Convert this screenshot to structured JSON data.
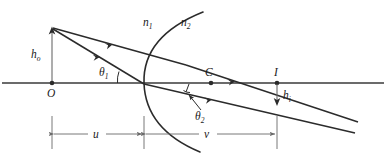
{
  "figure": {
    "type": "optics-ray-diagram",
    "background_color": "#ffffff",
    "line_color": "#2b2b2b",
    "dimension_line_color": "#6a6a6a"
  },
  "labels": {
    "object_point": "O",
    "object_height": "h",
    "object_height_sub": "o",
    "index_left": "n",
    "index_left_sub": "1",
    "index_right": "n",
    "index_right_sub": "2",
    "angle_incidence": "θ",
    "angle_incidence_sub": "1",
    "angle_refraction": "θ",
    "angle_refraction_sub": "2",
    "center_of_curvature": "C",
    "image_point": "I",
    "image_height": "h",
    "image_height_sub": "i",
    "object_distance": "u",
    "image_distance": "v"
  },
  "geometry": {
    "axis_y": 83,
    "vertex_x": 144,
    "object_x": 52,
    "object_tip_y": 28,
    "center_x": 211,
    "image_x": 277,
    "image_y": 105,
    "arc_top": [
      203,
      12
    ],
    "arc_bottom": [
      200,
      152
    ],
    "dimension_y": 134
  }
}
